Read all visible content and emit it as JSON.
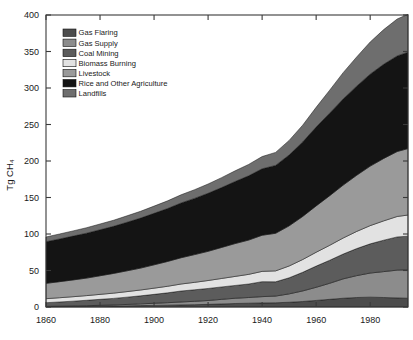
{
  "chart_data": {
    "type": "area",
    "title": "",
    "xlabel": "",
    "ylabel": "Tg CH4",
    "ylabel_display": "Tg CH₄",
    "xlim": [
      1860,
      1994
    ],
    "ylim": [
      0,
      400
    ],
    "ytick_labels": [
      "0",
      "50",
      "100",
      "150",
      "200",
      "250",
      "300",
      "350",
      "400"
    ],
    "yticks": [
      0,
      50,
      100,
      150,
      200,
      250,
      300,
      350,
      400
    ],
    "xtick_labels": [
      "1860",
      "1880",
      "1900",
      "1920",
      "1940",
      "1960",
      "1980"
    ],
    "xticks": [
      1860,
      1880,
      1900,
      1920,
      1940,
      1960,
      1980
    ],
    "grid": false,
    "legend_position": "upper-left-inside",
    "stacking_order_bottom_to_top": [
      "Gas Flaring",
      "Gas Supply",
      "Coal Mining",
      "Biomass Burning",
      "Livestock",
      "Rice and Other Agriculture",
      "Landfills"
    ],
    "x": [
      1860,
      1865,
      1870,
      1875,
      1880,
      1885,
      1890,
      1895,
      1900,
      1905,
      1910,
      1915,
      1920,
      1925,
      1930,
      1935,
      1940,
      1945,
      1950,
      1955,
      1960,
      1965,
      1970,
      1975,
      1980,
      1985,
      1990,
      1994
    ],
    "series": [
      {
        "name": "Gas Flaring",
        "color": "#4c4c4c",
        "values": [
          0.5,
          0.6,
          0.7,
          0.9,
          1.1,
          1.3,
          1.6,
          1.9,
          2.2,
          2.5,
          2.9,
          3.2,
          3.6,
          4.2,
          4.8,
          5.2,
          5.6,
          5.8,
          6.5,
          7.5,
          9.0,
          10.5,
          12.0,
          13.0,
          13.5,
          13.0,
          12.5,
          12.0
        ]
      },
      {
        "name": "Gas Supply",
        "color": "#8c8c8c",
        "values": [
          0.4,
          0.5,
          0.7,
          0.9,
          1.2,
          1.5,
          1.9,
          2.4,
          2.9,
          3.4,
          4.0,
          4.6,
          5.3,
          6.3,
          7.2,
          7.8,
          8.6,
          9.2,
          11.5,
          14.5,
          18.0,
          22.0,
          26.5,
          30.0,
          33.0,
          35.5,
          38.0,
          39.0
        ]
      },
      {
        "name": "Coal Mining",
        "color": "#5c5c5c",
        "values": [
          5.0,
          5.8,
          6.6,
          7.4,
          8.2,
          9.0,
          10.0,
          11.0,
          12.2,
          13.5,
          15.0,
          15.8,
          16.5,
          17.0,
          17.5,
          18.5,
          20.5,
          19.5,
          22.0,
          25.5,
          29.0,
          31.5,
          34.0,
          37.0,
          40.0,
          43.0,
          45.5,
          46.0
        ]
      },
      {
        "name": "Biomass Burning",
        "color": "#e2e2e2",
        "values": [
          5.5,
          5.8,
          6.1,
          6.4,
          6.8,
          7.2,
          7.6,
          8.0,
          8.5,
          9.0,
          9.6,
          10.2,
          10.9,
          11.6,
          12.4,
          13.2,
          14.1,
          15.0,
          16.2,
          17.5,
          19.0,
          20.5,
          22.0,
          23.5,
          25.0,
          26.5,
          28.0,
          29.0
        ]
      },
      {
        "name": "Livestock",
        "color": "#9a9a9a",
        "values": [
          21.0,
          22.0,
          23.0,
          24.0,
          25.5,
          27.0,
          28.5,
          30.0,
          32.0,
          34.0,
          36.0,
          38.0,
          40.0,
          42.5,
          45.0,
          47.0,
          49.5,
          51.5,
          55.0,
          59.0,
          63.5,
          68.0,
          72.5,
          77.0,
          81.5,
          85.5,
          89.0,
          91.0
        ]
      },
      {
        "name": "Rice and Other Agriculture",
        "color": "#141414",
        "values": [
          57.0,
          58.5,
          60.0,
          61.5,
          63.0,
          64.5,
          66.5,
          68.5,
          70.5,
          72.5,
          75.0,
          77.0,
          79.5,
          82.0,
          85.0,
          88.0,
          91.0,
          93.0,
          97.0,
          102.0,
          108.0,
          113.0,
          118.0,
          122.0,
          126.0,
          129.0,
          131.0,
          132.0
        ]
      },
      {
        "name": "Landfills",
        "color": "#6e6e6e",
        "values": [
          6.5,
          6.8,
          7.1,
          7.5,
          7.9,
          8.3,
          8.8,
          9.3,
          9.9,
          10.5,
          11.2,
          11.9,
          12.7,
          13.6,
          14.6,
          15.6,
          16.8,
          17.8,
          20.0,
          23.0,
          27.0,
          31.5,
          36.0,
          40.0,
          44.0,
          47.5,
          50.5,
          52.0
        ]
      }
    ],
    "legend_entries": [
      {
        "label": "Gas Flaring",
        "color": "#4c4c4c"
      },
      {
        "label": "Gas Supply",
        "color": "#8c8c8c"
      },
      {
        "label": "Coal Mining",
        "color": "#5c5c5c"
      },
      {
        "label": "Biomass Burning",
        "color": "#e2e2e2"
      },
      {
        "label": "Livestock",
        "color": "#9a9a9a"
      },
      {
        "label": "Rice and Other Agriculture",
        "color": "#141414"
      },
      {
        "label": "Landfills",
        "color": "#6e6e6e"
      }
    ]
  }
}
